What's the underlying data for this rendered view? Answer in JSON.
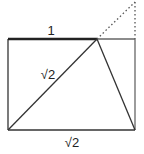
{
  "diagram": {
    "labels": {
      "top_edge": "1",
      "diagonal": "√2",
      "bottom_edge": "√2"
    },
    "colors": {
      "stroke": "#333333",
      "thick_stroke": "#222222",
      "right_edge": "#666666",
      "dotted": "#555555"
    }
  }
}
